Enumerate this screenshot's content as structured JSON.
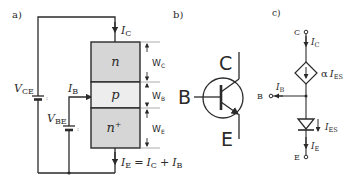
{
  "panels": {
    "a": {
      "label": "a)",
      "regions": {
        "collector": "n",
        "base": "p",
        "emitter": "n",
        "emitter_sup": "+"
      },
      "widths": {
        "collector": "W",
        "collector_sub": "C",
        "base": "W",
        "base_sub": "B",
        "emitter": "W",
        "emitter_sub": "E"
      },
      "currents": {
        "ic": "I",
        "ic_sub": "C",
        "ib": "I",
        "ib_sub": "B",
        "ie_eq": {
          "ie": "I",
          "ie_sub": "E",
          "eq": "=",
          "ic": "I",
          "ic_sub": "C",
          "plus": "+",
          "ib": "I",
          "ib_sub": "B"
        }
      },
      "voltages": {
        "vce": "V",
        "vce_sub": "CE",
        "vbe": "V",
        "vbe_sub": "BE"
      }
    },
    "b": {
      "label": "b)",
      "terminals": {
        "collector": "C",
        "base": "B",
        "emitter": "E"
      }
    },
    "c": {
      "label": "c)",
      "terminals": {
        "collector": "C",
        "base": "B",
        "emitter": "E"
      },
      "currents": {
        "ic": "I",
        "ic_sub": "C",
        "ib": "I",
        "ib_sub": "B",
        "ie": "I",
        "ie_sub": "E",
        "ies": "I",
        "ies_sub": "ES",
        "source_alpha": "α",
        "source_i": "I",
        "source_sub": "ES"
      }
    }
  },
  "colors": {
    "line": "#2a2a2a",
    "n_fill": "#d6d6d6",
    "p_fill": "#ededed",
    "dim_line": "#9a9a9a"
  }
}
